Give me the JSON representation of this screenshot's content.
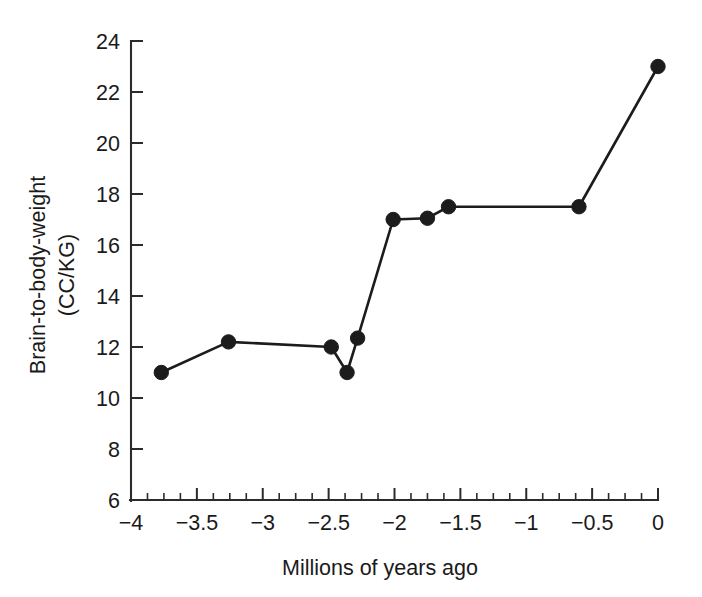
{
  "chart_data": {
    "type": "line",
    "title": "",
    "subtitle": "",
    "xlabel": "Millions of years ago",
    "ylabel": "Brain-to-body-weight (CC/KG)",
    "ylabel_line1": "Brain-to-body-weight",
    "ylabel_line2": "(CC/KG)",
    "xlim": [
      -4,
      0
    ],
    "ylim": [
      6,
      24
    ],
    "x_ticks": [
      -4,
      -3.5,
      -3,
      -2.5,
      -2,
      -1.5,
      -1,
      -0.5,
      0
    ],
    "x_tick_labels": [
      "−4",
      "−3.5",
      "−3",
      "−2.5",
      "−2",
      "−1.5",
      "−1",
      "−0.5",
      "0"
    ],
    "x_minor_tick_step": 0.125,
    "y_ticks": [
      6,
      8,
      10,
      12,
      14,
      16,
      18,
      20,
      22,
      24
    ],
    "y_tick_labels": [
      "6",
      "8",
      "10",
      "12",
      "14",
      "16",
      "18",
      "20",
      "22",
      "24"
    ],
    "grid": false,
    "legend": null,
    "legend_position": "none",
    "marker": "filled-circle",
    "line_color": "#1c1c1c",
    "marker_color": "#1c1c1c",
    "background_color": "#ffffff",
    "series": [
      {
        "name": "Brain-to-body-weight",
        "x": [
          -3.77,
          -3.26,
          -2.48,
          -2.36,
          -2.28,
          -2.01,
          -1.75,
          -1.59,
          -0.6,
          0.0
        ],
        "y": [
          11.0,
          12.2,
          12.0,
          11.0,
          12.35,
          17.0,
          17.05,
          17.5,
          17.5,
          23.0
        ],
        "points": [
          {
            "x": -3.77,
            "y": 11.0
          },
          {
            "x": -3.26,
            "y": 12.2
          },
          {
            "x": -2.48,
            "y": 12.0
          },
          {
            "x": -2.36,
            "y": 11.0
          },
          {
            "x": -2.28,
            "y": 12.35
          },
          {
            "x": -2.01,
            "y": 17.0
          },
          {
            "x": -1.75,
            "y": 17.05
          },
          {
            "x": -1.59,
            "y": 17.5
          },
          {
            "x": -0.6,
            "y": 17.5
          },
          {
            "x": 0.0,
            "y": 23.0
          }
        ]
      }
    ]
  }
}
